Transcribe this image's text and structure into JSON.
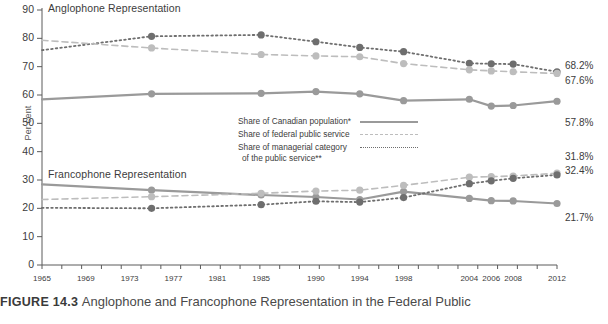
{
  "figure": {
    "number": "FIGURE 14.3",
    "title": "Anglophone and Francophone Representation in the Federal Public"
  },
  "axes": {
    "ylabel": "Per cent",
    "yticks": [
      "90",
      "80",
      "70",
      "60",
      "50",
      "40",
      "30",
      "20",
      "10",
      "0"
    ],
    "ylim": [
      0,
      90
    ],
    "xticks": [
      "1965",
      "1969",
      "1973",
      "1977",
      "1981",
      "1985",
      "1990",
      "1994",
      "1998",
      "2004",
      "2006",
      "2008",
      "2012"
    ]
  },
  "sections": {
    "anglophone": "Anglophone Representation",
    "francophone": "Francophone Representation"
  },
  "legend": {
    "position": "inside-center-right",
    "items": [
      {
        "label": "Share of Canadian population*",
        "label2": "",
        "key": "solid",
        "color": "#9a9a9a"
      },
      {
        "label": "Share of federal public service",
        "label2": "",
        "key": "dash",
        "color": "#bdbdbd"
      },
      {
        "label": "Share of managerial category",
        "label2": "of the public service**",
        "key": "dot",
        "color": "#6e6e6e"
      }
    ]
  },
  "end_labels": {
    "anglophone": [
      "68.2%",
      "67.6%",
      "57.8%"
    ],
    "francophone": [
      "32.4%",
      "31.8%",
      "21.7%"
    ]
  },
  "chart_data": {
    "type": "line",
    "title": "Anglophone and Francophone Representation in the Federal Public",
    "xlabel": "",
    "ylabel": "Per cent",
    "ylim": [
      0,
      90
    ],
    "grid": false,
    "x": [
      1965,
      1975,
      1985,
      1990,
      1994,
      1998,
      2004,
      2006,
      2008,
      2012
    ],
    "xtick_labels": [
      "1965",
      "1969",
      "1973",
      "1977",
      "1981",
      "1985",
      "1990",
      "1994",
      "1998",
      "2004",
      "2006",
      "2008",
      "2012"
    ],
    "groups": [
      {
        "name": "Anglophone Representation",
        "series": [
          {
            "name": "Share of managerial category of the public service**",
            "style": "dot",
            "color": "#6e6e6e",
            "values": [
              75.8,
              80.7,
              81.2,
              78.8,
              76.8,
              75.3,
              71.2,
              71.0,
              70.9,
              68.2
            ],
            "end_label": "68.2%"
          },
          {
            "name": "Share of federal public service",
            "style": "dash",
            "color": "#bdbdbd",
            "values": [
              79.3,
              76.6,
              74.3,
              73.8,
              73.5,
              71.1,
              68.9,
              68.5,
              68.2,
              67.6
            ],
            "end_label": "67.6%"
          },
          {
            "name": "Share of Canadian population*",
            "style": "solid",
            "color": "#9a9a9a",
            "values": [
              58.5,
              60.4,
              60.6,
              61.2,
              60.4,
              58.0,
              58.5,
              56.1,
              56.3,
              57.8
            ],
            "end_label": "57.8%"
          }
        ]
      },
      {
        "name": "Francophone Representation",
        "series": [
          {
            "name": "Share of Canadian population*",
            "style": "solid",
            "color": "#9a9a9a",
            "values": [
              28.5,
              26.4,
              24.7,
              24.0,
              23.1,
              25.9,
              23.5,
              22.7,
              22.6,
              21.7
            ],
            "end_label": "21.7%"
          },
          {
            "name": "Share of federal public service",
            "style": "dash",
            "color": "#bdbdbd",
            "values": [
              23.1,
              24.1,
              25.3,
              26.1,
              26.4,
              28.1,
              31.0,
              31.2,
              31.4,
              32.4
            ],
            "end_label": "32.4%"
          },
          {
            "name": "Share of managerial category of the public service**",
            "style": "dot",
            "color": "#6e6e6e",
            "values": [
              20.2,
              20.0,
              21.3,
              22.5,
              22.2,
              23.8,
              28.7,
              29.7,
              30.6,
              31.8
            ],
            "end_label": "31.8%"
          }
        ]
      }
    ]
  }
}
